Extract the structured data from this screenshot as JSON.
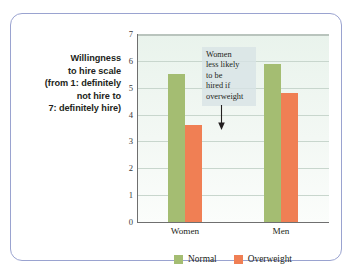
{
  "y_axis_title": {
    "lines": [
      "Willingness",
      "to hire scale",
      "(from 1: definitely",
      "not hire to",
      "7: definitely hire)"
    ]
  },
  "annotation": {
    "lines": [
      "Women",
      "less likely",
      "to be",
      "hired if",
      "overweight"
    ],
    "arrow": "down-arrow-icon"
  },
  "legend": {
    "items": [
      {
        "label": "Normal",
        "color": "#a4bd72"
      },
      {
        "label": "Overweight",
        "color": "#f07f54"
      }
    ]
  },
  "chart_data": {
    "type": "bar",
    "title": "",
    "xlabel": "",
    "ylabel": "Willingness to hire scale (from 1: definitely not hire to 7: definitely hire)",
    "categories": [
      "Women",
      "Men"
    ],
    "series": [
      {
        "name": "Normal",
        "color": "#a4bd72",
        "values": [
          5.5,
          5.9
        ]
      },
      {
        "name": "Overweight",
        "color": "#f07f54",
        "values": [
          3.6,
          4.8
        ]
      }
    ],
    "ylim": [
      0,
      7
    ],
    "yticks": [
      0,
      1,
      2,
      3,
      4,
      5,
      6,
      7
    ],
    "ytick_labels": [
      "0",
      "1",
      "2",
      "3",
      "4",
      "5",
      "6",
      "7"
    ],
    "grid": true,
    "legend_position": "bottom",
    "annotations": [
      {
        "text": "Women less likely to be hired if overweight",
        "points_to": {
          "category": "Women",
          "series": "Overweight",
          "value": 3.6
        }
      }
    ]
  }
}
